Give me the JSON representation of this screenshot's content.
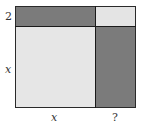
{
  "diagram": {
    "colors": {
      "dark": "#7b7b7b",
      "light": "#e6e6e6",
      "border": "#1a1a1a"
    },
    "regions": [
      {
        "name": "top-left-rect",
        "shade": "dark",
        "width_label": "x",
        "height_label": "2"
      },
      {
        "name": "top-right-square",
        "shade": "light",
        "width_label": "?",
        "height_label": "2"
      },
      {
        "name": "main-square",
        "shade": "light",
        "width_label": "x",
        "height_label": "x"
      },
      {
        "name": "right-rect",
        "shade": "dark",
        "width_label": "?",
        "height_label": "x"
      }
    ],
    "labels": {
      "left_top": "2",
      "left_main": "x",
      "bottom_main": "x",
      "bottom_right": "?"
    }
  }
}
